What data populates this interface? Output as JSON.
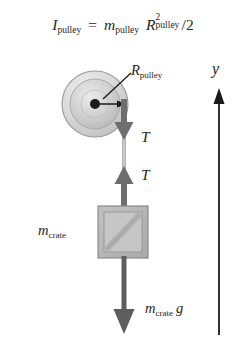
{
  "figure": {
    "title_equation": {
      "lhs_symbol": "I",
      "lhs_subscript": "pulley",
      "equals": "=",
      "mass_symbol": "m",
      "mass_subscript": "pulley",
      "radius_symbol": "R",
      "radius_superscript": "2",
      "radius_subscript": "pulley",
      "divisor": "/2",
      "plain_text": "I_pulley = m_pulley R^2_pulley /2"
    },
    "pulley": {
      "radius_label_symbol": "R",
      "radius_label_subscript": "pulley",
      "center_x": 95,
      "center_y": 104,
      "outer_radius": 33,
      "inner_radius": 25,
      "hub_radius": 5,
      "fill_color": "#d5d5d5",
      "inner_fill_color": "#c8c8c8",
      "edge_color": "#8f8f8f",
      "hub_color": "#1a1a1a"
    },
    "forces": {
      "tension_upper_label": "T",
      "tension_lower_label": "T",
      "weight_mass_symbol": "m",
      "weight_mass_subscript": "crate",
      "weight_gravity_symbol": "g",
      "arrow_color": "#6e6e6e",
      "weight_arrow_color": "#5e5e5e"
    },
    "crate": {
      "mass_symbol": "m",
      "mass_subscript": "crate",
      "x": 98,
      "y": 206,
      "width": 50,
      "height": 52,
      "fill_color": "#b9b9b9",
      "inner_fill_color": "#c4c4c4",
      "edge_color": "#8a8a8a"
    },
    "rope": {
      "x": 124,
      "color": "#b0b0b0"
    },
    "axis": {
      "label": "y",
      "x": 219,
      "top_y": 90,
      "bottom_y": 335,
      "color": "#1a1a1a"
    },
    "background_color": "#ffffff"
  }
}
